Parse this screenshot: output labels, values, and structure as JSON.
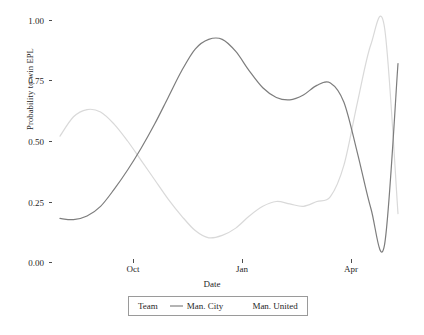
{
  "chart_data": {
    "type": "line",
    "title": "",
    "xlabel": "Date",
    "ylabel": "Probability to win EPL",
    "ylim": [
      0.0,
      1.0
    ],
    "y_ticks": [
      0.0,
      0.25,
      0.5,
      0.75,
      1.0
    ],
    "y_tick_labels": [
      "0.00",
      "0.25",
      "0.50",
      "0.75",
      "1.00"
    ],
    "x_ticks": [
      "Oct",
      "Jan",
      "Apr"
    ],
    "x_tick_labels": [
      "Oct",
      "Jan",
      "Apr"
    ],
    "grid": false,
    "legend_position": "bottom",
    "legend_title": "Team",
    "colors": {
      "man_city": "#7d7d7d",
      "man_united": "#d9d9d9",
      "axis_text": "#1f1f1f",
      "tick_mark": "#4d4d4d",
      "legend_border": "#9a9a9a",
      "background": "#ffffff"
    },
    "series": [
      {
        "name": "Man. City",
        "color": "#7d7d7d",
        "x": [
          0.0,
          0.04,
          0.08,
          0.12,
          0.16,
          0.2,
          0.24,
          0.28,
          0.32,
          0.36,
          0.4,
          0.44,
          0.48,
          0.52,
          0.56,
          0.6,
          0.64,
          0.68,
          0.72,
          0.76,
          0.8,
          0.84,
          0.88,
          0.92,
          0.96,
          1.0
        ],
        "values": [
          0.18,
          0.175,
          0.19,
          0.23,
          0.3,
          0.38,
          0.47,
          0.57,
          0.68,
          0.79,
          0.88,
          0.92,
          0.92,
          0.87,
          0.79,
          0.72,
          0.68,
          0.67,
          0.69,
          0.73,
          0.74,
          0.66,
          0.45,
          0.22,
          0.07,
          0.82
        ]
      },
      {
        "name": "Man. United",
        "color": "#d9d9d9",
        "x": [
          0.0,
          0.04,
          0.08,
          0.12,
          0.16,
          0.2,
          0.24,
          0.28,
          0.32,
          0.36,
          0.4,
          0.44,
          0.48,
          0.52,
          0.56,
          0.6,
          0.64,
          0.68,
          0.72,
          0.76,
          0.8,
          0.84,
          0.88,
          0.92,
          0.96,
          1.0
        ],
        "values": [
          0.52,
          0.6,
          0.63,
          0.62,
          0.57,
          0.5,
          0.42,
          0.34,
          0.26,
          0.19,
          0.13,
          0.1,
          0.11,
          0.14,
          0.19,
          0.23,
          0.25,
          0.24,
          0.23,
          0.25,
          0.27,
          0.4,
          0.66,
          0.9,
          0.97,
          0.2
        ]
      }
    ]
  },
  "axes": {
    "y_title": "Probability to win EPL",
    "x_title": "Date",
    "y_labels": [
      "1.00",
      "0.75",
      "0.50",
      "0.25",
      "0.00"
    ],
    "x_labels": [
      "Oct",
      "Jan",
      "Apr"
    ]
  },
  "legend": {
    "title": "Team",
    "items": [
      {
        "label": "Man. City",
        "color": "#7d7d7d",
        "key": "line-key"
      },
      {
        "label": "Man. United",
        "color": "#d9d9d9",
        "key": "line-key"
      }
    ]
  }
}
